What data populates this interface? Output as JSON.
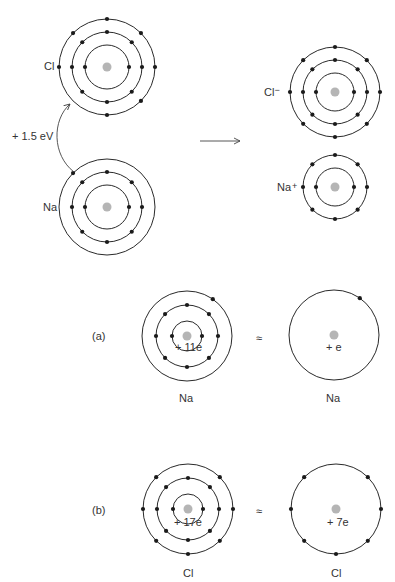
{
  "colors": {
    "shell": "#2a2a2a",
    "electron": "#1a1a1a",
    "nucleus": "#b5b5b5",
    "text": "#333333"
  },
  "reaction": {
    "energy_label": "+ 1.5 eV",
    "reactants": [
      {
        "id": "cl",
        "label": "Cl",
        "shells": [
          2,
          8,
          7
        ],
        "outer_angles_deg": [
          90,
          135,
          45,
          180,
          0,
          315,
          270
        ]
      },
      {
        "id": "na",
        "label": "Na",
        "shells": [
          2,
          8,
          1
        ],
        "outer_angles_deg": [
          135
        ]
      }
    ],
    "products": [
      {
        "id": "cl-ion",
        "label": "Cl",
        "sign": "−",
        "shells": [
          2,
          8,
          8
        ]
      },
      {
        "id": "na-ion",
        "label": "Na",
        "sign": "+",
        "shells": [
          2,
          8
        ]
      }
    ]
  },
  "panels": [
    {
      "tag": "(a)",
      "approx": "≈",
      "full": {
        "label": "Na",
        "charge": "+ 11e",
        "shells": [
          2,
          8,
          1
        ],
        "outer_angles_deg": [
          55
        ]
      },
      "simple": {
        "label": "Na",
        "charge": "+ e",
        "shells": [
          1
        ],
        "outer_angles_deg": [
          55
        ]
      }
    },
    {
      "tag": "(b)",
      "approx": "≈",
      "full": {
        "label": "Cl",
        "charge": "+ 17e",
        "shells": [
          2,
          8,
          7
        ],
        "outer_angles_deg": [
          135,
          45,
          180,
          0,
          225,
          315,
          270
        ]
      },
      "simple": {
        "label": "Cl",
        "charge": "+ 7e",
        "shells": [
          7
        ],
        "outer_angles_deg": [
          135,
          45,
          180,
          0,
          225,
          315,
          270
        ]
      }
    }
  ]
}
